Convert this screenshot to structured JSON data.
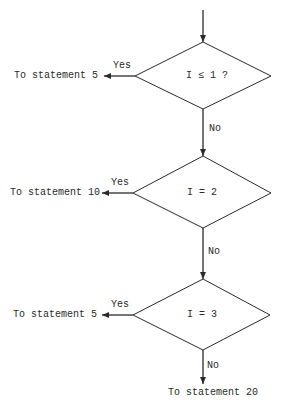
{
  "diagram": {
    "type": "flowchart",
    "colors": {
      "line": "#2a2a2a",
      "background": "#ffffff",
      "text": "#2a2a2a"
    },
    "decisions": [
      {
        "condition": "I ≤ 1 ?",
        "yes_label": "Yes",
        "yes_target": "To statement 5",
        "no_label": "No"
      },
      {
        "condition": "I = 2",
        "yes_label": "Yes",
        "yes_target": "To statement 10",
        "no_label": "No"
      },
      {
        "condition": "I = 3",
        "yes_label": "Yes",
        "yes_target": "To statement 5",
        "no_label": "No"
      }
    ],
    "final_target": "To statement 20"
  }
}
